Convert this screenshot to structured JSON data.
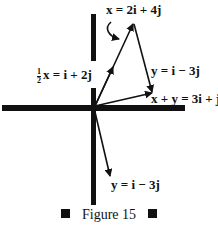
{
  "figure": {
    "caption": "Figure 15",
    "labels": {
      "x_vector": "x = 2i + 4j",
      "half_x_prefix_num": "1",
      "half_x_prefix_den": "2",
      "half_x_rest": "x = i + 2j",
      "y_vector_upper": "y = i − 3j",
      "sum_vector": "x + y = 3i + j",
      "y_vector_lower": "y = i − 3j"
    },
    "colors": {
      "ink": "#111111",
      "background": "#ffffff"
    }
  }
}
